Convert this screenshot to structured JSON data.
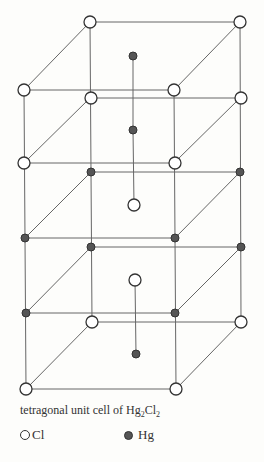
{
  "figure": {
    "caption_prefix": "tetragonal unit cell of Hg",
    "caption_sub1": "2",
    "caption_mid": "Cl",
    "caption_sub2": "2",
    "legend": [
      {
        "symbol": "open-circle",
        "label": "Cl"
      },
      {
        "symbol": "filled-circle",
        "label": "Hg"
      }
    ],
    "colors": {
      "line": "#555555",
      "cl_fill": "#ffffff",
      "hg_fill": "#555555",
      "stroke": "#333333"
    }
  }
}
